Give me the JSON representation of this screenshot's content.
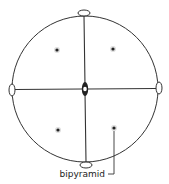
{
  "diagram": {
    "type": "stereographic-projection",
    "colors": {
      "line": "#333333",
      "background": "#ffffff"
    },
    "elements": {
      "primitive_circle": "primitive circle",
      "mirror_lines": [
        "vertical mirror plane",
        "horizontal mirror plane"
      ],
      "center_axis": "2-fold axis (lens symbol) at center",
      "edge_axes": [
        "top 2-fold axis",
        "bottom 2-fold axis",
        "left 2-fold axis",
        "right 2-fold axis"
      ],
      "poles": [
        "upper-left pole",
        "upper-right pole",
        "lower-left pole",
        "lower-right pole"
      ]
    },
    "label": "bipyramid"
  }
}
